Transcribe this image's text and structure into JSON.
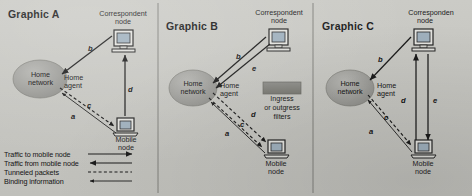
{
  "figure": {
    "background_color": "#c6c6c1",
    "ink_color": "#1b1b1b"
  },
  "panels": [
    {
      "id": "a",
      "title": "Graphic A",
      "correspondent_node": {
        "line1": "Correspondent",
        "line2": "node",
        "icon": "desktop-computer-icon"
      },
      "mobile_node": {
        "line1": "Mobile",
        "line2": "node",
        "icon": "laptop-computer-icon"
      },
      "home_network": {
        "line1": "Home",
        "line2": "network",
        "icon": "cloud-ellipse-icon"
      },
      "home_agent": {
        "line1": "Home",
        "line2": "agent"
      },
      "edge_labels": [
        "b",
        "d",
        "c",
        "a"
      ]
    },
    {
      "id": "b",
      "title": "Graphic B",
      "correspondent_node": {
        "line1": "Correspondent",
        "line2": "node",
        "icon": "desktop-computer-icon"
      },
      "mobile_node": {
        "line1": "Mobile",
        "line2": "node",
        "icon": "laptop-computer-icon"
      },
      "home_network": {
        "line1": "Home",
        "line2": "network",
        "icon": "cloud-ellipse-icon"
      },
      "home_agent": {
        "line1": "Home",
        "line2": "agent"
      },
      "filter_box": {
        "line1": "Ingress",
        "line2": "or outgress",
        "line3": "filters",
        "icon": "filter-box-icon"
      },
      "edge_labels": [
        "b",
        "e",
        "d",
        "c",
        "a"
      ]
    },
    {
      "id": "c",
      "title": "Graphic C",
      "correspondent_node": {
        "line1": "Corresponden",
        "line2": "node",
        "icon": "desktop-computer-icon"
      },
      "mobile_node": {
        "line1": "Mobile",
        "line2": "node",
        "icon": "laptop-computer-icon"
      },
      "home_network": {
        "line1": "Home",
        "line2": "network",
        "icon": "cloud-ellipse-icon"
      },
      "home_agent": {
        "line1": "Home",
        "line2": "agent"
      },
      "edge_labels": [
        "b",
        "d",
        "e",
        "c",
        "a"
      ]
    }
  ],
  "legend": {
    "items": [
      {
        "label": "Traffic to mobile node",
        "style": "solid-arrow-right"
      },
      {
        "label": "Traffic from mobile node",
        "style": "solid-arrow-left"
      },
      {
        "label": "Tunneled packets",
        "style": "dashed-line"
      },
      {
        "label": "Binding information",
        "style": "thin-arrow-left"
      }
    ]
  }
}
